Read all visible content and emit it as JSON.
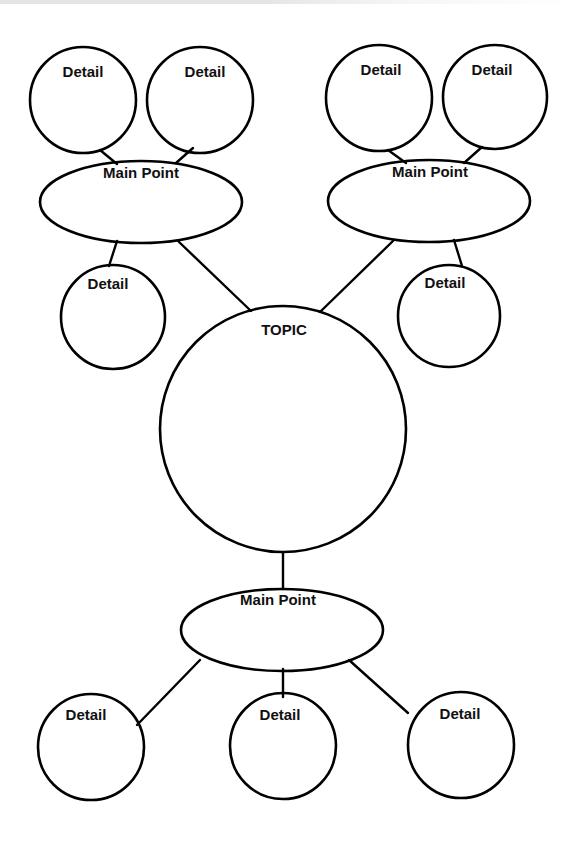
{
  "diagram": {
    "type": "concept-map",
    "stroke_color": "#000000",
    "background_color": "#ffffff",
    "topic": {
      "label": "TOPIC",
      "cx": 283,
      "cy": 429,
      "r": 123,
      "label_x": 284,
      "label_y": 322
    },
    "main_points": [
      {
        "id": "main-point-left",
        "label": "Main Point",
        "cx": 141,
        "cy": 202,
        "rx": 101,
        "ry": 41,
        "label_x": 141,
        "label_y": 165
      },
      {
        "id": "main-point-right",
        "label": "Main Point",
        "cx": 429,
        "cy": 201,
        "rx": 101,
        "ry": 41,
        "label_x": 430,
        "label_y": 164
      },
      {
        "id": "main-point-bottom",
        "label": "Main Point",
        "cx": 282,
        "cy": 630,
        "rx": 101,
        "ry": 41,
        "label_x": 278,
        "label_y": 592
      }
    ],
    "details": [
      {
        "id": "detail-top-left-1",
        "label": "Detail",
        "cx": 83,
        "cy": 100,
        "r": 53,
        "label_x": 83,
        "label_y": 64,
        "parent": "main-point-left"
      },
      {
        "id": "detail-top-left-2",
        "label": "Detail",
        "cx": 200,
        "cy": 100,
        "r": 53,
        "label_x": 205,
        "label_y": 64,
        "parent": "main-point-left"
      },
      {
        "id": "detail-mid-left",
        "label": "Detail",
        "cx": 113,
        "cy": 317,
        "r": 52,
        "label_x": 108,
        "label_y": 276,
        "parent": "main-point-left"
      },
      {
        "id": "detail-top-right-1",
        "label": "Detail",
        "cx": 379,
        "cy": 98,
        "r": 53,
        "label_x": 381,
        "label_y": 62,
        "parent": "main-point-right"
      },
      {
        "id": "detail-top-right-2",
        "label": "Detail",
        "cx": 495,
        "cy": 97,
        "r": 52,
        "label_x": 492,
        "label_y": 62,
        "parent": "main-point-right"
      },
      {
        "id": "detail-mid-right",
        "label": "Detail",
        "cx": 449,
        "cy": 316,
        "r": 51,
        "label_x": 445,
        "label_y": 275,
        "parent": "main-point-right"
      },
      {
        "id": "detail-bottom-left",
        "label": "Detail",
        "cx": 91,
        "cy": 747,
        "r": 53,
        "label_x": 86,
        "label_y": 707,
        "parent": "main-point-bottom"
      },
      {
        "id": "detail-bottom-middle",
        "label": "Detail",
        "cx": 283,
        "cy": 746,
        "r": 53,
        "label_x": 280,
        "label_y": 707,
        "parent": "main-point-bottom"
      },
      {
        "id": "detail-bottom-right",
        "label": "Detail",
        "cx": 461,
        "cy": 745,
        "r": 53,
        "label_x": 460,
        "label_y": 706,
        "parent": "main-point-bottom"
      }
    ],
    "connectors": [
      {
        "id": "conn-tl1-mpl",
        "x1": 100,
        "y1": 150,
        "x2": 117,
        "y2": 164
      },
      {
        "id": "conn-tl2-mpl",
        "x1": 193,
        "y1": 148,
        "x2": 176,
        "y2": 163
      },
      {
        "id": "conn-mpl-ml",
        "x1": 117,
        "y1": 241,
        "x2": 109,
        "y2": 266
      },
      {
        "id": "conn-mpl-topic",
        "x1": 178,
        "y1": 241,
        "x2": 251,
        "y2": 311
      },
      {
        "id": "conn-tr1-mpr",
        "x1": 388,
        "y1": 150,
        "x2": 406,
        "y2": 163
      },
      {
        "id": "conn-tr2-mpr",
        "x1": 482,
        "y1": 147,
        "x2": 464,
        "y2": 163
      },
      {
        "id": "conn-mpr-topic",
        "x1": 394,
        "y1": 240,
        "x2": 320,
        "y2": 312
      },
      {
        "id": "conn-mpr-mr",
        "x1": 454,
        "y1": 240,
        "x2": 462,
        "y2": 266
      },
      {
        "id": "conn-topic-mpb",
        "x1": 283,
        "y1": 553,
        "x2": 283,
        "y2": 589
      },
      {
        "id": "conn-mpb-bl",
        "x1": 200,
        "y1": 660,
        "x2": 137,
        "y2": 725
      },
      {
        "id": "conn-mpb-bm",
        "x1": 283,
        "y1": 669,
        "x2": 283,
        "y2": 697
      },
      {
        "id": "conn-mpb-br",
        "x1": 349,
        "y1": 660,
        "x2": 408,
        "y2": 713
      }
    ]
  }
}
